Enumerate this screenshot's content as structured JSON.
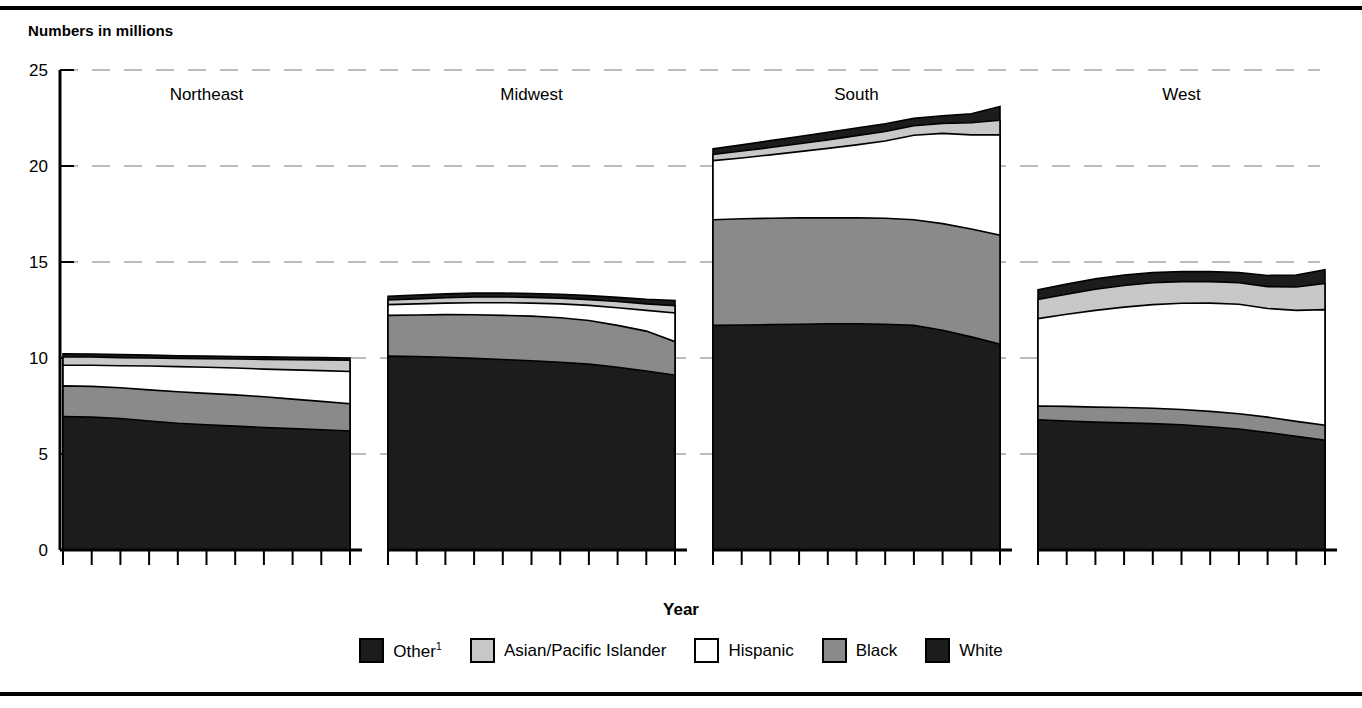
{
  "figure": {
    "subtitle": "Numbers in millions",
    "x_axis_label": "Year",
    "top_rule": true,
    "bottom_rule": true
  },
  "legend": {
    "position": "bottom-center",
    "items": [
      {
        "label": "Other",
        "superscript": "1",
        "color": "#1c1c1c",
        "name": "other"
      },
      {
        "label": "Asian/Pacific Islander",
        "superscript": "",
        "color": "#c8c8c8",
        "name": "asian-pacific-islander"
      },
      {
        "label": "Hispanic",
        "superscript": "",
        "color": "#ffffff",
        "name": "hispanic"
      },
      {
        "label": "Black",
        "superscript": "",
        "color": "#8a8a8a",
        "name": "black"
      },
      {
        "label": "White",
        "superscript": "",
        "color": "#1c1c1c",
        "name": "white"
      }
    ]
  },
  "chart_data": {
    "type": "area",
    "title": "",
    "subtitle": "Numbers in millions",
    "xlabel": "Year",
    "ylabel": "",
    "ylim": [
      0,
      25
    ],
    "yticks": [
      0,
      5,
      10,
      15,
      20,
      25
    ],
    "ytick_labels": [
      "0",
      "5",
      "10",
      "15",
      "20",
      "25"
    ],
    "grid": true,
    "grid_style": "dashed-light-gray",
    "x": [
      2000,
      2001,
      2002,
      2003,
      2004,
      2005,
      2006,
      2007,
      2008,
      2009,
      2010
    ],
    "xtick_labels_shown": [
      "2000",
      "2010"
    ],
    "stack_order_bottom_to_top": [
      "White",
      "Black",
      "Hispanic",
      "Asian/Pacific Islander",
      "Other"
    ],
    "panels": [
      {
        "name": "Northeast",
        "xticks": [
          "2000",
          "2010"
        ],
        "series": [
          {
            "name": "White",
            "color": "#1c1c1c",
            "values": [
              6.95,
              6.92,
              6.85,
              6.72,
              6.6,
              6.52,
              6.45,
              6.38,
              6.32,
              6.26,
              6.2
            ]
          },
          {
            "name": "Black",
            "color": "#8a8a8a",
            "values": [
              8.55,
              8.52,
              8.45,
              8.34,
              8.24,
              8.16,
              8.08,
              7.98,
              7.86,
              7.74,
              7.62
            ]
          },
          {
            "name": "Hispanic",
            "color": "#ffffff",
            "values": [
              9.62,
              9.62,
              9.6,
              9.58,
              9.55,
              9.52,
              9.48,
              9.42,
              9.38,
              9.34,
              9.3
            ]
          },
          {
            "name": "Asian/Pacific Islander",
            "color": "#c8c8c8",
            "values": [
              10.05,
              10.05,
              10.02,
              10.0,
              9.98,
              9.96,
              9.95,
              9.93,
              9.91,
              9.9,
              9.88
            ]
          },
          {
            "name": "Other",
            "color": "#1c1c1c",
            "values": [
              10.22,
              10.2,
              10.18,
              10.15,
              10.12,
              10.1,
              10.08,
              10.06,
              10.04,
              10.02,
              10.0
            ]
          }
        ]
      },
      {
        "name": "Midwest",
        "xticks": [
          "2000",
          "2010"
        ],
        "series": [
          {
            "name": "White",
            "color": "#1c1c1c",
            "values": [
              10.1,
              10.08,
              10.04,
              9.98,
              9.92,
              9.86,
              9.78,
              9.68,
              9.52,
              9.32,
              9.1
            ]
          },
          {
            "name": "Black",
            "color": "#8a8a8a",
            "values": [
              12.22,
              12.24,
              12.26,
              12.25,
              12.22,
              12.18,
              12.1,
              11.95,
              11.7,
              11.4,
              10.85
            ]
          },
          {
            "name": "Hispanic",
            "color": "#ffffff",
            "values": [
              12.78,
              12.82,
              12.86,
              12.88,
              12.88,
              12.86,
              12.82,
              12.74,
              12.62,
              12.48,
              12.35
            ]
          },
          {
            "name": "Asian/Pacific Islander",
            "color": "#c8c8c8",
            "values": [
              13.02,
              13.08,
              13.14,
              13.18,
              13.18,
              13.16,
              13.12,
              13.04,
              12.94,
              12.82,
              12.72
            ]
          },
          {
            "name": "Other",
            "color": "#1c1c1c",
            "values": [
              13.22,
              13.28,
              13.34,
              13.38,
              13.38,
              13.36,
              13.32,
              13.25,
              13.16,
              13.06,
              13.0
            ]
          }
        ]
      },
      {
        "name": "South",
        "xticks": [
          "2000",
          "2010"
        ],
        "series": [
          {
            "name": "White",
            "color": "#1c1c1c",
            "values": [
              11.7,
              11.72,
              11.74,
              11.76,
              11.78,
              11.78,
              11.76,
              11.7,
              11.45,
              11.1,
              10.72
            ]
          },
          {
            "name": "Black",
            "color": "#8a8a8a",
            "values": [
              17.2,
              17.25,
              17.28,
              17.3,
              17.3,
              17.3,
              17.28,
              17.2,
              17.0,
              16.72,
              16.4
            ]
          },
          {
            "name": "Hispanic",
            "color": "#ffffff",
            "values": [
              20.28,
              20.42,
              20.58,
              20.75,
              20.92,
              21.1,
              21.3,
              21.6,
              21.7,
              21.62,
              21.62
            ]
          },
          {
            "name": "Asian/Pacific Islander",
            "color": "#c8c8c8",
            "values": [
              20.6,
              20.78,
              20.96,
              21.16,
              21.36,
              21.58,
              21.8,
              22.1,
              22.22,
              22.25,
              22.38
            ]
          },
          {
            "name": "Other",
            "color": "#1c1c1c",
            "values": [
              20.9,
              21.1,
              21.32,
              21.54,
              21.76,
              21.98,
              22.2,
              22.48,
              22.62,
              22.72,
              23.1
            ]
          }
        ]
      },
      {
        "name": "West",
        "xticks": [
          "2000",
          "2010"
        ],
        "series": [
          {
            "name": "White",
            "color": "#1c1c1c",
            "values": [
              6.78,
              6.72,
              6.66,
              6.62,
              6.58,
              6.52,
              6.42,
              6.3,
              6.12,
              5.92,
              5.72
            ]
          },
          {
            "name": "Black",
            "color": "#8a8a8a",
            "values": [
              7.5,
              7.48,
              7.44,
              7.42,
              7.38,
              7.32,
              7.22,
              7.1,
              6.92,
              6.7,
              6.5
            ]
          },
          {
            "name": "Hispanic",
            "color": "#ffffff",
            "values": [
              12.05,
              12.28,
              12.48,
              12.65,
              12.78,
              12.85,
              12.86,
              12.8,
              12.58,
              12.48,
              12.52
            ]
          },
          {
            "name": "Asian/Pacific Islander",
            "color": "#c8c8c8",
            "values": [
              13.05,
              13.32,
              13.58,
              13.78,
              13.92,
              13.98,
              13.98,
              13.92,
              13.72,
              13.7,
              13.88
            ]
          },
          {
            "name": "Other",
            "color": "#1c1c1c",
            "values": [
              13.55,
              13.85,
              14.12,
              14.32,
              14.45,
              14.5,
              14.5,
              14.45,
              14.3,
              14.32,
              14.6
            ]
          }
        ]
      }
    ]
  }
}
